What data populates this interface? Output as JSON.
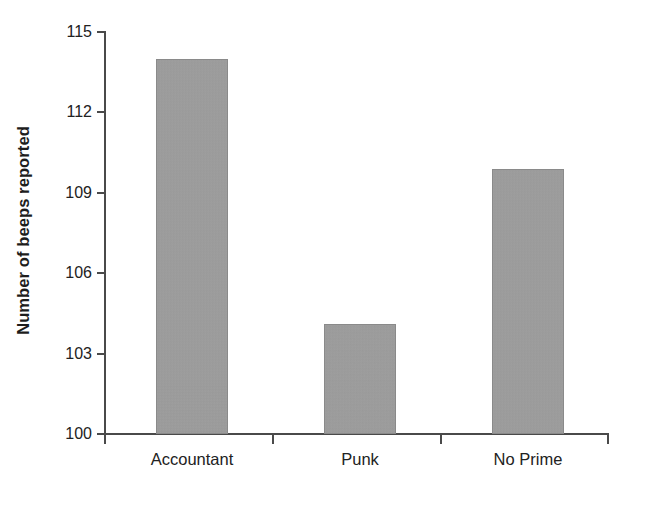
{
  "chart_data": {
    "type": "bar",
    "title": "",
    "subtitle": "",
    "xlabel": "",
    "ylabel": "Number of beeps reported",
    "categories": [
      "Accountant",
      "Punk",
      "No Prime"
    ],
    "values": [
      114.0,
      104.1,
      109.9
    ],
    "series": [
      {
        "name": "Number of beeps reported",
        "values": [
          114.0,
          104.1,
          109.9
        ]
      }
    ],
    "ylim": [
      100,
      115
    ],
    "yticks": [
      100,
      103,
      106,
      109,
      112,
      115
    ],
    "ytick_labels": [
      "100",
      "103",
      "106",
      "109",
      "112",
      "115"
    ],
    "grid": false,
    "legend": false,
    "legend_position": "none",
    "bar_color": "#9e9e9e",
    "bar_edge_color": "#8a8a8a",
    "axis_color": "#4a4a4a",
    "background_color": "#ffffff",
    "text_color": "#222222"
  },
  "axis": {
    "y_title": "Number of beeps reported",
    "tick_labels": [
      "115",
      "112",
      "109",
      "106",
      "103",
      "100"
    ]
  },
  "categories": {
    "items": [
      {
        "label": "Accountant",
        "value": "114.0"
      },
      {
        "label": "Punk",
        "value": "104.1"
      },
      {
        "label": "No Prime",
        "value": "109.9"
      }
    ]
  }
}
